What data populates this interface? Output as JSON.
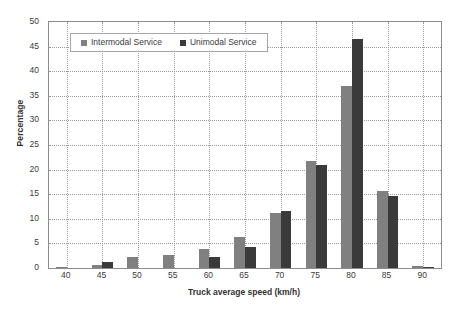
{
  "chart_data": {
    "type": "bar",
    "title": "",
    "subtitle": "",
    "xlabel": "Truck average speed (km/h)",
    "ylabel": "Percentage",
    "categories": [
      "40",
      "45",
      "50",
      "55",
      "60",
      "65",
      "70",
      "75",
      "80",
      "85",
      "90"
    ],
    "series": [
      {
        "name": "Intermodal Service",
        "color": "#808080",
        "values": [
          0.2,
          0.6,
          2.2,
          2.6,
          3.9,
          6.3,
          11.2,
          21.7,
          37.0,
          15.6,
          0.4
        ]
      },
      {
        "name": "Unimodal Service",
        "color": "#3a3a3a",
        "values": [
          0.0,
          1.2,
          0.0,
          0.0,
          2.2,
          4.3,
          11.6,
          20.9,
          46.5,
          14.6,
          0.3
        ]
      }
    ],
    "xlim": [
      37.5,
      92.5
    ],
    "ylim": [
      0,
      50
    ],
    "yticks": [
      0,
      5,
      10,
      15,
      20,
      25,
      30,
      35,
      40,
      45,
      50
    ],
    "ytick_labels": [
      "0",
      "5",
      "10",
      "15",
      "20",
      "25",
      "30",
      "35",
      "40",
      "45",
      "50"
    ],
    "xticks": [
      40,
      45,
      50,
      55,
      60,
      65,
      70,
      75,
      80,
      85,
      90
    ],
    "xtick_labels": [
      "40",
      "45",
      "50",
      "55",
      "60",
      "65",
      "70",
      "75",
      "80",
      "85",
      "90"
    ],
    "grid": true,
    "grid_style": "dotted",
    "grid_color": "#9a9a9a",
    "legend_position": "top-left-inside",
    "axis_color": "#8d8d8d",
    "background": "#ffffff"
  },
  "legend": {
    "entries": [
      {
        "label": "Intermodal Service",
        "color": "#808080"
      },
      {
        "label": "Unimodal Service",
        "color": "#3a3a3a"
      }
    ]
  }
}
